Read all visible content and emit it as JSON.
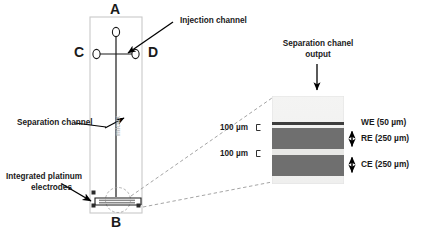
{
  "figure": {
    "type": "microfluidic-chip-schematic",
    "background": "#ffffff"
  },
  "chip": {
    "outline_color": "#c9c9c9",
    "channel_color": "#1a1a1a",
    "reservoirs": [
      {
        "id": "A",
        "label": "A",
        "position": "top"
      },
      {
        "id": "B",
        "label": "B",
        "position": "bottom"
      },
      {
        "id": "C",
        "label": "C",
        "position": "left"
      },
      {
        "id": "D",
        "label": "D",
        "position": "right"
      }
    ],
    "inline_vertical_text": "micux"
  },
  "annotations": {
    "injection_channel": "Injection channel",
    "separation_channel": "Separation channel",
    "integrated_electrodes_line1": "Integrated platinum",
    "integrated_electrodes_line2": "electrodes",
    "separation_output_line1": "Separation chanel",
    "separation_output_line2": "output"
  },
  "micrograph": {
    "gap_labels": [
      "100 µm",
      "100 µm"
    ],
    "electrodes": [
      {
        "name": "WE",
        "width": "50 µm",
        "label": "WE (50 µm)"
      },
      {
        "name": "RE",
        "width": "250 µm",
        "label": "RE (250 µm)"
      },
      {
        "name": "CE",
        "width": "250 µm",
        "label": "CE (250 µm)"
      }
    ],
    "band_color": "#6f6f6f",
    "film_color": "#efefef",
    "thin_line_color": "#3d3d3d"
  }
}
